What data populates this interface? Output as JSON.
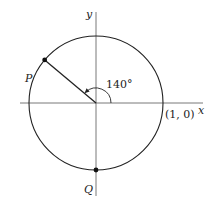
{
  "diagram": {
    "type": "unit-circle",
    "axis_labels": {
      "x": "x",
      "y": "y"
    },
    "angle_label": "140°",
    "angle_degrees": 140,
    "point_labels": {
      "P": "P",
      "Q": "Q"
    },
    "reference_point_label": "(1, 0)",
    "points": [
      {
        "name": "P",
        "angle_degrees": 140
      },
      {
        "name": "Q",
        "angle_degrees": 270
      }
    ],
    "colors": {
      "stroke": "#222222",
      "axis": "#555555"
    }
  }
}
